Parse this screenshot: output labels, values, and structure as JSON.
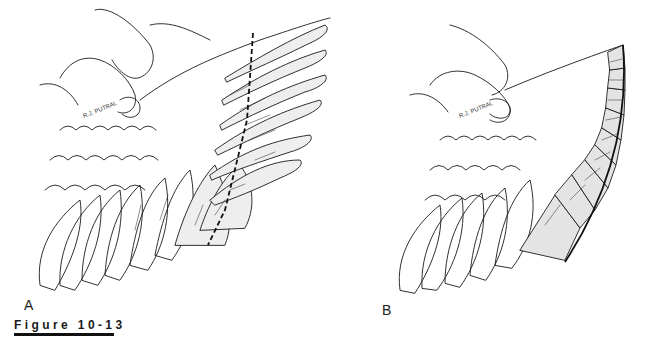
{
  "figure": {
    "caption": "Figure 10-13",
    "panels": [
      {
        "label": "A",
        "description": "Hand holding spread bird wing with dashed cut line across primary flight feathers"
      },
      {
        "label": "B",
        "description": "Same wing after primary feathers have been clipped along a curved line"
      }
    ],
    "artist_signature": "R.J. PUTRAL",
    "icons": {
      "cut_line": "dashed-cut-line",
      "clip_edge": "curved-clip-edge"
    },
    "colors": {
      "ink": "#111111",
      "background": "#ffffff"
    }
  }
}
